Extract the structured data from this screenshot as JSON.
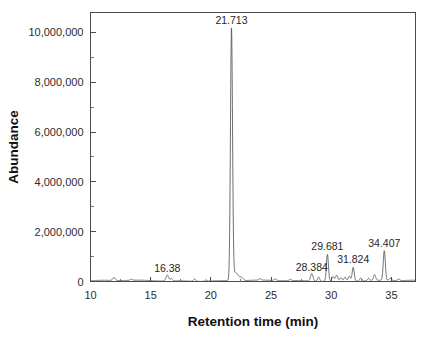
{
  "chart_data": {
    "type": "line",
    "title": "",
    "subtitle": "",
    "xlabel": "Retention time (min)",
    "ylabel": "Abundance",
    "xlim": [
      10,
      37
    ],
    "ylim": [
      0,
      10800000
    ],
    "grid": false,
    "legend": null,
    "x_ticks": [
      10,
      15,
      20,
      25,
      30,
      35
    ],
    "x_tick_labels": [
      "10",
      "15",
      "20",
      "25",
      "30",
      "35"
    ],
    "x_minor_ticks": [
      12.5,
      17.5,
      22.5,
      27.5,
      32.5
    ],
    "y_ticks": [
      0,
      2000000,
      4000000,
      6000000,
      8000000,
      10000000
    ],
    "y_tick_labels": [
      "0",
      "2,000,000",
      "4,000,000",
      "6,000,000",
      "8,000,000",
      "10,000,000"
    ],
    "y_minor_ticks": [
      1000000,
      3000000,
      5000000,
      7000000,
      9000000
    ],
    "annotations": [
      {
        "label": "16.38",
        "x": 16.38,
        "y": 250000
      },
      {
        "label": "21.713",
        "x": 21.713,
        "y": 10400000
      },
      {
        "label": "28.384",
        "x": 28.384,
        "y": 300000
      },
      {
        "label": "29.681",
        "x": 29.681,
        "y": 1150000
      },
      {
        "label": "31.824",
        "x": 31.824,
        "y": 620000
      },
      {
        "label": "34.407",
        "x": 34.407,
        "y": 1250000
      }
    ],
    "series": [
      {
        "name": "TIC",
        "color": "#555555",
        "baseline": 30000,
        "peaks": [
          {
            "rt": 11.95,
            "height": 120000,
            "width": 0.1
          },
          {
            "rt": 13.4,
            "height": 45000,
            "width": 0.09
          },
          {
            "rt": 16.38,
            "height": 235000,
            "width": 0.11
          },
          {
            "rt": 16.72,
            "height": 95000,
            "width": 0.09
          },
          {
            "rt": 18.65,
            "height": 90000,
            "width": 0.1
          },
          {
            "rt": 19.6,
            "height": 50000,
            "width": 0.09
          },
          {
            "rt": 21.713,
            "height": 10050000,
            "width": 0.085
          },
          {
            "rt": 22.05,
            "height": 330000,
            "width": 0.22
          },
          {
            "rt": 22.55,
            "height": 120000,
            "width": 0.14
          },
          {
            "rt": 24.1,
            "height": 55000,
            "width": 0.1
          },
          {
            "rt": 25.35,
            "height": 60000,
            "width": 0.1
          },
          {
            "rt": 26.6,
            "height": 45000,
            "width": 0.09
          },
          {
            "rt": 28.384,
            "height": 300000,
            "width": 0.1
          },
          {
            "rt": 28.95,
            "height": 170000,
            "width": 0.09
          },
          {
            "rt": 29.681,
            "height": 1080000,
            "width": 0.085
          },
          {
            "rt": 30.15,
            "height": 180000,
            "width": 0.09
          },
          {
            "rt": 30.45,
            "height": 230000,
            "width": 0.09
          },
          {
            "rt": 30.8,
            "height": 130000,
            "width": 0.09
          },
          {
            "rt": 31.15,
            "height": 150000,
            "width": 0.09
          },
          {
            "rt": 31.5,
            "height": 200000,
            "width": 0.09
          },
          {
            "rt": 31.824,
            "height": 560000,
            "width": 0.085
          },
          {
            "rt": 32.45,
            "height": 120000,
            "width": 0.09
          },
          {
            "rt": 33.1,
            "height": 95000,
            "width": 0.09
          },
          {
            "rt": 33.6,
            "height": 230000,
            "width": 0.09
          },
          {
            "rt": 34.407,
            "height": 1190000,
            "width": 0.085
          },
          {
            "rt": 34.9,
            "height": 90000,
            "width": 0.09
          },
          {
            "rt": 35.6,
            "height": 60000,
            "width": 0.09
          }
        ]
      }
    ]
  }
}
